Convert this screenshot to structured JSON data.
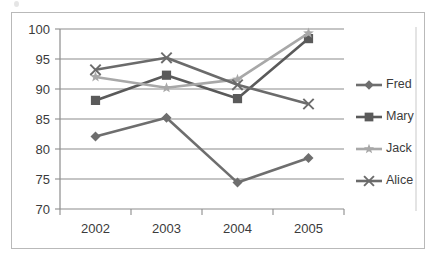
{
  "chart_data": {
    "type": "line",
    "title": "",
    "subtitle": "",
    "xlabel": "",
    "ylabel": "",
    "categories": [
      "2002",
      "2003",
      "2004",
      "2005"
    ],
    "x": [
      2002,
      2003,
      2004,
      2005
    ],
    "ylim": [
      70,
      100
    ],
    "y_ticks": [
      70,
      75,
      80,
      85,
      90,
      95,
      100
    ],
    "y_tick_labels": [
      "70",
      "75",
      "80",
      "85",
      "90",
      "95",
      "100"
    ],
    "grid": "horizontal",
    "legend_position": "right",
    "series": [
      {
        "name": "Fred",
        "marker": "diamond",
        "color": "#6e6e6e",
        "values": [
          82.1,
          85.2,
          74.4,
          78.5
        ]
      },
      {
        "name": "Mary",
        "marker": "square",
        "color": "#5a5a5a",
        "values": [
          88.1,
          92.3,
          88.4,
          98.4
        ]
      },
      {
        "name": "Jack",
        "marker": "star",
        "color": "#a8a8a8",
        "values": [
          92.0,
          90.2,
          91.6,
          99.3
        ]
      },
      {
        "name": "Alice",
        "marker": "x",
        "color": "#6b6b6b",
        "values": [
          93.2,
          95.2,
          90.7,
          87.5
        ]
      }
    ]
  },
  "colors": {
    "frame_border": "#b9b9b9",
    "gridline": "#8c8c8c",
    "axis_line": "#8c8c8c",
    "tick_text": "#3b3b3b",
    "legend_divider": "#c9c9c9",
    "background": "#ffffff"
  },
  "legend": {
    "entries": [
      {
        "label": "Fred"
      },
      {
        "label": "Mary"
      },
      {
        "label": "Jack"
      },
      {
        "label": "Alice"
      }
    ]
  },
  "axes": {
    "y_axis_min_label": "70",
    "y_axis_max_label": "100",
    "x_axis_first_label": "2002",
    "x_axis_last_label": "2005"
  }
}
